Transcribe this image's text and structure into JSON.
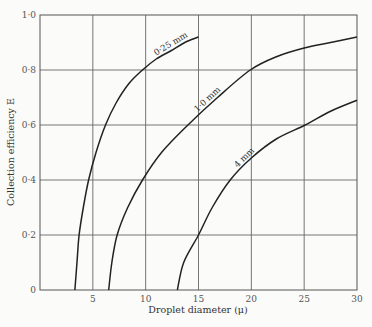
{
  "chart_data": {
    "type": "line",
    "title": "",
    "xlabel": "Droplet diameter (μ)",
    "ylabel": "Collection efficiency E",
    "xlim": [
      0,
      30
    ],
    "ylim": [
      0,
      1.0
    ],
    "grid": true,
    "x_ticks": [
      5,
      10,
      15,
      20,
      25,
      30
    ],
    "x_tick_labels": [
      "5",
      "10",
      "15",
      "20",
      "25",
      "30"
    ],
    "y_ticks": [
      0,
      0.2,
      0.4,
      0.6,
      0.8,
      1.0
    ],
    "y_tick_labels": [
      "0",
      "0·2",
      "0·4",
      "0·6",
      "0·8",
      "1·0"
    ],
    "series": [
      {
        "name": "0·25 mm",
        "x": [
          3.3,
          3.5,
          3.7,
          4.1,
          4.6,
          5.3,
          6.2,
          7.2,
          8.4,
          9.7,
          11.0,
          12.4,
          13.7,
          15.0
        ],
        "y": [
          0.0,
          0.1,
          0.2,
          0.3,
          0.4,
          0.5,
          0.6,
          0.68,
          0.75,
          0.8,
          0.84,
          0.87,
          0.9,
          0.92
        ]
      },
      {
        "name": "1·0 mm",
        "x": [
          6.5,
          6.8,
          7.3,
          8.3,
          9.7,
          11.5,
          14.0,
          16.8,
          19.9,
          22.5,
          25.0,
          27.5,
          30.0
        ],
        "y": [
          0.0,
          0.1,
          0.2,
          0.3,
          0.4,
          0.5,
          0.6,
          0.7,
          0.8,
          0.85,
          0.88,
          0.9,
          0.92
        ]
      },
      {
        "name": "4 mm",
        "x": [
          13.0,
          13.6,
          15.0,
          16.3,
          18.0,
          20.0,
          22.4,
          25.1,
          27.5,
          30.0
        ],
        "y": [
          0.0,
          0.1,
          0.2,
          0.3,
          0.4,
          0.48,
          0.55,
          0.6,
          0.65,
          0.69
        ]
      }
    ],
    "annotations": [
      {
        "text": "0·25 mm",
        "series": 0,
        "at_x": 12.5
      },
      {
        "text": "1·0 mm",
        "series": 1,
        "at_x": 16.0
      },
      {
        "text": "4 mm",
        "series": 2,
        "at_x": 19.5
      }
    ]
  }
}
